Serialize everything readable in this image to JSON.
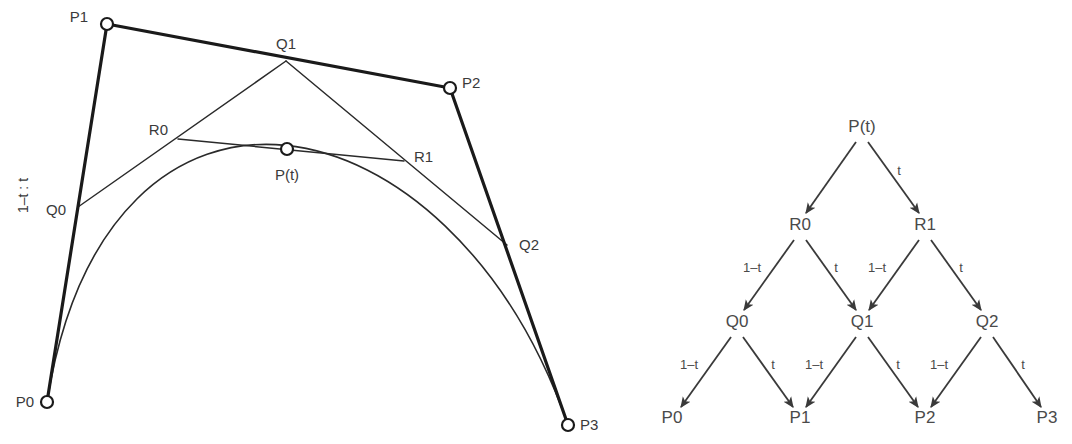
{
  "figure": {
    "background_color": "#ffffff",
    "ink_color": "#1a1a1a"
  },
  "left_diagram": {
    "name": "de-casteljau-geometry",
    "ratio_annotation": "1–t : t",
    "control_points": [
      {
        "id": "P0",
        "label": "P0",
        "x": 47,
        "y": 402,
        "marker": "circle"
      },
      {
        "id": "P1",
        "label": "P1",
        "x": 107,
        "y": 24,
        "marker": "circle"
      },
      {
        "id": "P2",
        "label": "P2",
        "x": 450,
        "y": 88,
        "marker": "circle"
      },
      {
        "id": "P3",
        "label": "P3",
        "x": 568,
        "y": 425,
        "marker": "circle"
      }
    ],
    "first_level_points": [
      {
        "id": "Q0",
        "label": "Q0",
        "x": 78,
        "y": 207,
        "marker": "none"
      },
      {
        "id": "Q1",
        "label": "Q1",
        "x": 286,
        "y": 61,
        "marker": "none"
      },
      {
        "id": "Q2",
        "label": "Q2",
        "x": 507,
        "y": 245,
        "marker": "none"
      }
    ],
    "second_level_points": [
      {
        "id": "R0",
        "label": "R0",
        "x": 178,
        "y": 139,
        "marker": "none"
      },
      {
        "id": "R1",
        "label": "R1",
        "x": 404,
        "y": 161,
        "marker": "none"
      }
    ],
    "curve_point": {
      "id": "Pt",
      "label": "P(t)",
      "x": 287,
      "y": 149,
      "marker": "circle"
    },
    "point_labels": [
      {
        "text": "P1",
        "x": 88,
        "y": 22,
        "anchor": "end"
      },
      {
        "text": "P2",
        "x": 462,
        "y": 88,
        "anchor": "start"
      },
      {
        "text": "P0",
        "x": 34,
        "y": 407,
        "anchor": "end"
      },
      {
        "text": "P3",
        "x": 580,
        "y": 430,
        "anchor": "start"
      },
      {
        "text": "Q0",
        "x": 66,
        "y": 215,
        "anchor": "end"
      },
      {
        "text": "Q1",
        "x": 286,
        "y": 49,
        "anchor": "middle"
      },
      {
        "text": "Q2",
        "x": 519,
        "y": 250,
        "anchor": "start"
      },
      {
        "text": "R0",
        "x": 168,
        "y": 135,
        "anchor": "end"
      },
      {
        "text": "R1",
        "x": 414,
        "y": 162,
        "anchor": "start"
      },
      {
        "text": "P(t)",
        "x": 287,
        "y": 180,
        "anchor": "middle"
      }
    ],
    "hull_segments": [
      {
        "from": "P0",
        "to": "P1"
      },
      {
        "from": "P1",
        "to": "P2"
      },
      {
        "from": "P2",
        "to": "P3"
      }
    ],
    "construction_segments": [
      {
        "from": "Q0",
        "to": "Q1"
      },
      {
        "from": "Q1",
        "to": "Q2"
      },
      {
        "from": "R0",
        "to": "R1"
      }
    ],
    "bezier_curve": {
      "start": "P0",
      "control1": "P1",
      "control2": "P2",
      "end": "P3",
      "parameter_t": 0.5
    }
  },
  "right_diagram": {
    "name": "de-casteljau-tree",
    "levels": [
      {
        "level": 0,
        "nodes": [
          {
            "label": "P(t)",
            "x": 862,
            "y": 132
          }
        ]
      },
      {
        "level": 1,
        "nodes": [
          {
            "label": "R0",
            "x": 800,
            "y": 230
          },
          {
            "label": "R1",
            "x": 925,
            "y": 230
          }
        ]
      },
      {
        "level": 2,
        "nodes": [
          {
            "label": "Q0",
            "x": 737,
            "y": 327
          },
          {
            "label": "Q1",
            "x": 862,
            "y": 327
          },
          {
            "label": "Q2",
            "x": 987,
            "y": 327
          }
        ]
      },
      {
        "level": 3,
        "nodes": [
          {
            "label": "P0",
            "x": 672,
            "y": 423
          },
          {
            "label": "P1",
            "x": 800,
            "y": 423
          },
          {
            "label": "P2",
            "x": 925,
            "y": 423
          },
          {
            "label": "P3",
            "x": 1047,
            "y": 423
          }
        ]
      }
    ],
    "edges": [
      {
        "from": "P(t)",
        "to": "R0",
        "weight": "",
        "x1": 856,
        "y1": 142,
        "x2": 806,
        "y2": 213,
        "lx": 0,
        "ly": 0
      },
      {
        "from": "P(t)",
        "to": "R1",
        "weight": "t",
        "x1": 868,
        "y1": 142,
        "x2": 919,
        "y2": 213,
        "lx": 899,
        "ly": 175
      },
      {
        "from": "R0",
        "to": "Q0",
        "weight": "1–t",
        "x1": 794,
        "y1": 240,
        "x2": 744,
        "y2": 310,
        "lx": 752,
        "ly": 272
      },
      {
        "from": "R0",
        "to": "Q1",
        "weight": "t",
        "x1": 806,
        "y1": 240,
        "x2": 856,
        "y2": 310,
        "lx": 836,
        "ly": 272
      },
      {
        "from": "R1",
        "to": "Q1",
        "weight": "1–t",
        "x1": 919,
        "y1": 240,
        "x2": 869,
        "y2": 310,
        "lx": 877,
        "ly": 272
      },
      {
        "from": "R1",
        "to": "Q2",
        "weight": "t",
        "x1": 931,
        "y1": 240,
        "x2": 981,
        "y2": 310,
        "lx": 961,
        "ly": 272
      },
      {
        "from": "Q0",
        "to": "P0",
        "weight": "1–t",
        "x1": 731,
        "y1": 337,
        "x2": 681,
        "y2": 407,
        "lx": 689,
        "ly": 369
      },
      {
        "from": "Q0",
        "to": "P1",
        "weight": "t",
        "x1": 743,
        "y1": 337,
        "x2": 793,
        "y2": 407,
        "lx": 773,
        "ly": 369
      },
      {
        "from": "Q1",
        "to": "P1",
        "weight": "1–t",
        "x1": 856,
        "y1": 337,
        "x2": 806,
        "y2": 407,
        "lx": 814,
        "ly": 369
      },
      {
        "from": "Q1",
        "to": "P2",
        "weight": "t",
        "x1": 868,
        "y1": 337,
        "x2": 918,
        "y2": 407,
        "lx": 898,
        "ly": 369
      },
      {
        "from": "Q2",
        "to": "P2",
        "weight": "1–t",
        "x1": 981,
        "y1": 337,
        "x2": 931,
        "y2": 407,
        "lx": 939,
        "ly": 369
      },
      {
        "from": "Q2",
        "to": "P3",
        "weight": "t",
        "x1": 993,
        "y1": 337,
        "x2": 1041,
        "y2": 407,
        "lx": 1023,
        "ly": 369
      }
    ]
  }
}
